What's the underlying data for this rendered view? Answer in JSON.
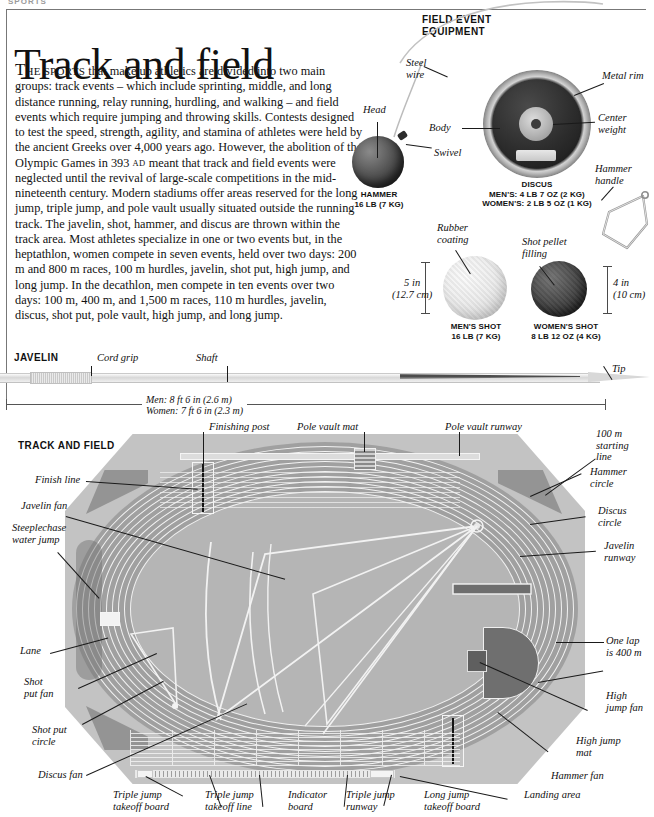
{
  "running_head": "SPORTS",
  "title": "Track and field",
  "intro": {
    "dropcap": "T",
    "smallcaps": "HE SPORTS",
    "body_1": " that make up athletics are divided into two main groups: track events – which include sprinting, middle, and long distance running, relay running, hurdling, and walking – and field events which require jumping and throwing skills. Contests designed to test the speed, strength, agility, and stamina of athletes were held by the ancient Greeks over 4,000 years ago. However, the abolition of the Olympic Games in 393 ",
    "ad": "AD",
    "body_2": " meant that track and field events were neglected until the revival of large-scale competitions in the mid-nineteenth century. Modern stadiums offer areas reserved for the long jump, triple jump, and pole vault usually situated outside the running track. The javelin, shot, hammer, and discus are thrown within the track area. Most athletes specialize in one or two events but, in the heptathlon, women compete in seven events, held over two days: 200 m and 800 m races, 100 m hurdles, javelin, shot put, high jump, and long jump. In the decathlon, men compete in ten events over two days: 100 m, 400 m, and 1,500 m races, 110 m hurdles, javelin, discus, shot put, pole vault, high jump, and long jump."
  },
  "field_event_equipment": {
    "heading_line1": "FIELD EVENT",
    "heading_line2": "EQUIPMENT",
    "labels": {
      "steel_wire": "Steel\nwire",
      "head": "Head",
      "swivel": "Swivel",
      "body": "Body",
      "metal_rim": "Metal rim",
      "center_weight": "Center\nweight",
      "hammer_handle": "Hammer\nhandle",
      "rubber_coating": "Rubber\ncoating",
      "shot_pellet_filling": "Shot pellet\nfilling"
    },
    "specs": {
      "hammer_name": "HAMMER",
      "hammer_weight": "16 LB (7 KG)",
      "discus_name": "DISCUS",
      "discus_mens": "MEN'S: 4 LB 7 OZ (2 KG)",
      "discus_womens": "WOMEN'S: 2 LB 5 OZ (1 KG)",
      "mens_shot_name": "MEN'S SHOT",
      "mens_shot_weight": "16 LB (7 KG)",
      "womens_shot_name": "WOMEN'S SHOT",
      "womens_shot_weight": "8 LB 12 OZ (4 KG)",
      "mens_shot_dim": "5 in\n(12.7 cm)",
      "womens_shot_dim": "4 in\n(10 cm)"
    }
  },
  "javelin": {
    "heading": "JAVELIN",
    "labels": {
      "cord_grip": "Cord grip",
      "shaft": "Shaft",
      "tip": "Tip"
    },
    "dimension_men": "Men: 8 ft 6 in (2.6 m)",
    "dimension_women": "Women: 7 ft 6 in (2.3 m)"
  },
  "track_and_field": {
    "heading": "TRACK AND FIELD",
    "labels": {
      "finishing_post": "Finishing post",
      "pole_vault_mat": "Pole vault mat",
      "pole_vault_runway": "Pole vault runway",
      "starting_line_100m": "100 m\nstarting\nline",
      "finish_line": "Finish line",
      "javelin_fan": "Javelin fan",
      "steeplechase_water_jump": "Steeplechase\nwater jump",
      "lane": "Lane",
      "shot_put_fan": "Shot\nput fan",
      "shot_put_circle": "Shot put\ncircle",
      "discus_fan": "Discus fan",
      "hammer_circle": "Hammer\ncircle",
      "discus_circle": "Discus\ncircle",
      "javelin_runway": "Javelin\nrunway",
      "one_lap": "One lap\nis 400 m",
      "high_jump_fan": "High\njump fan",
      "high_jump_mat": "High jump\nmat",
      "hammer_fan": "Hammer fan",
      "triple_jump_takeoff_board": "Triple jump\ntakeoff board",
      "triple_jump_takeoff_line": "Triple jump\ntakeoff line",
      "indicator_board": "Indicator\nboard",
      "triple_jump_runway": "Triple jump\nrunway",
      "long_jump_takeoff_board": "Long jump\ntakeoff board",
      "landing_area": "Landing area"
    }
  },
  "colors": {
    "infield": "#b5b5b5",
    "track": "#9b9b9b",
    "surround": "#c3c3c3",
    "dark_segment": "#6e6e6e",
    "line": "#f2f2f2",
    "ink": "#111111"
  }
}
